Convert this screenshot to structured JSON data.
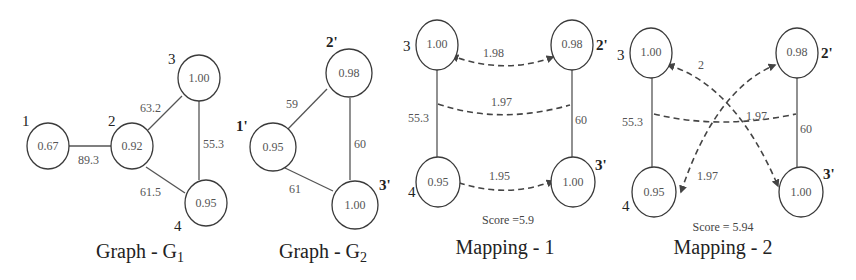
{
  "panels": [
    {
      "caption": "Graph - G",
      "caption_sub": "1",
      "nodes": [
        {
          "id": "1",
          "value": "0.67"
        },
        {
          "id": "2",
          "value": "0.92"
        },
        {
          "id": "3",
          "value": "1.00"
        },
        {
          "id": "4",
          "value": "0.95"
        }
      ],
      "edges": [
        {
          "from": "1",
          "to": "2",
          "weight": "89.3"
        },
        {
          "from": "2",
          "to": "3",
          "weight": "63.2"
        },
        {
          "from": "3",
          "to": "4",
          "weight": "55.3"
        },
        {
          "from": "2",
          "to": "4",
          "weight": "61.5"
        }
      ]
    },
    {
      "caption": "Graph - G",
      "caption_sub": "2",
      "nodes": [
        {
          "id": "1'",
          "value": "0.95"
        },
        {
          "id": "2'",
          "value": "0.98"
        },
        {
          "id": "3'",
          "value": "1.00"
        }
      ],
      "edges": [
        {
          "from": "1'",
          "to": "2'",
          "weight": "59"
        },
        {
          "from": "2'",
          "to": "3'",
          "weight": "60"
        },
        {
          "from": "1'",
          "to": "3'",
          "weight": "61"
        }
      ]
    },
    {
      "caption": "Mapping - 1",
      "score": "Score =5.9",
      "left_nodes": [
        {
          "id": "3",
          "value": "1.00"
        },
        {
          "id": "4",
          "value": "0.95"
        }
      ],
      "right_nodes": [
        {
          "id": "2'",
          "value": "0.98"
        },
        {
          "id": "3'",
          "value": "1.00"
        }
      ],
      "left_edge_weight": "55.3",
      "right_edge_weight": "60",
      "mappings": [
        {
          "from": "3",
          "to": "2'",
          "score": "1.98"
        },
        {
          "from": "edge(3,4)",
          "to": "edge(2',3')",
          "score": "1.97"
        },
        {
          "from": "4",
          "to": "3'",
          "score": "1.95"
        }
      ]
    },
    {
      "caption": "Mapping - 2",
      "score": "Score = 5.94",
      "left_nodes": [
        {
          "id": "3",
          "value": "1.00"
        },
        {
          "id": "4",
          "value": "0.95"
        }
      ],
      "right_nodes": [
        {
          "id": "2'",
          "value": "0.98"
        },
        {
          "id": "3'",
          "value": "1.00"
        }
      ],
      "left_edge_weight": "55.3",
      "right_edge_weight": "60",
      "mappings": [
        {
          "from": "3",
          "to": "3'",
          "score": "2"
        },
        {
          "from": "edge(3,4)",
          "to": "edge(2',3')",
          "score": "1.97"
        },
        {
          "from": "4",
          "to": "2'",
          "score": "1.97"
        }
      ]
    }
  ]
}
